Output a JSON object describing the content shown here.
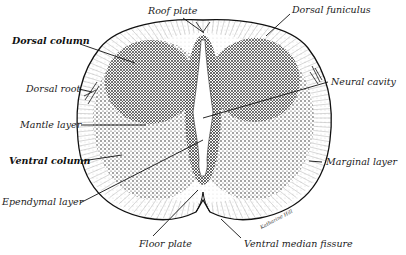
{
  "figure": {
    "signature": "Katharine Hill",
    "labels": {
      "roof_plate": "Roof plate",
      "dorsal_funiculus": "Dorsal funiculus",
      "dorsal_column": "Dorsal column",
      "dorsal_root": "Dorsal root",
      "neural_cavity": "Neural cavity",
      "mantle_layer": "Mantle layer",
      "ventral_column": "Ventral column",
      "marginal_layer": "Marginal layer",
      "ependymal_layer": "Ependymal layer",
      "floor_plate": "Floor plate",
      "ventral_median_fissure": "Ventral median fissure"
    },
    "colors": {
      "ink": "#111111",
      "dense_stipple": "#2a2a2a",
      "light_stipple": "#777777",
      "background": "#ffffff"
    }
  }
}
